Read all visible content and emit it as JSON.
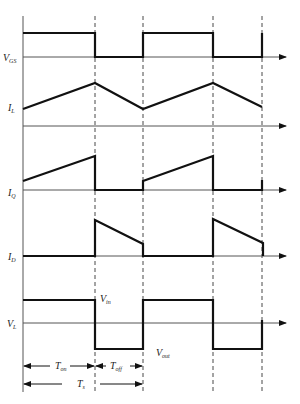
{
  "diagram": {
    "traces": [
      {
        "id": "vgs",
        "label_main": "V",
        "label_sub": "GS"
      },
      {
        "id": "il",
        "label_main": "I",
        "label_sub": "L"
      },
      {
        "id": "iq",
        "label_main": "I",
        "label_sub": "Q"
      },
      {
        "id": "id",
        "label_main": "I",
        "label_sub": "D"
      },
      {
        "id": "vl",
        "label_main": "V",
        "label_sub": "L"
      }
    ],
    "annotations": {
      "vin_main": "V",
      "vin_sub": "in",
      "vout_main": "V",
      "vout_sub": "out"
    },
    "timing": {
      "ton_main": "T",
      "ton_sub": "on",
      "toff_main": "T",
      "toff_sub": "off",
      "ts_main": "T",
      "ts_sub": "s"
    },
    "colors": {
      "line": "#111111",
      "axis": "#555555",
      "background": "#ffffff"
    }
  }
}
